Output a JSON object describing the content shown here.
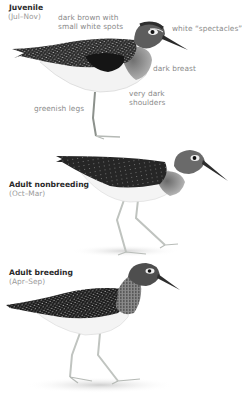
{
  "figures": [
    {
      "title": "Juvenile",
      "season": "(Jul–Nov)",
      "annotations": [
        {
          "line1": "dark brown with",
          "line2": "small white spots"
        },
        {
          "line1": "white “spectacles”"
        },
        {
          "line1": "dark breast"
        },
        {
          "line1": "very dark",
          "line2": "shoulders"
        },
        {
          "line1": "greenish legs"
        }
      ]
    },
    {
      "title": "Adult nonbreeding",
      "season": "(Oct–Mar)"
    },
    {
      "title": "Adult breeding",
      "season": "(Apr–Sep)"
    }
  ],
  "colors": {
    "title": "#2a2a2a",
    "label": "#8a8a8a",
    "plumage_dark": "#1f1f1f",
    "belly": "#f4f4f4",
    "legs": "#b9bdb9"
  },
  "icons": [
    "juvenile-sandpiper-illustration",
    "adult-nonbreeding-sandpiper-illustration",
    "adult-breeding-sandpiper-illustration"
  ]
}
